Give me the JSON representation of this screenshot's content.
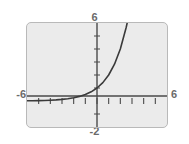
{
  "figure": {
    "name": "exponential-growth-graph-thumbnail",
    "background_color": "#ffffff",
    "plot_background_color": "#ebebeb",
    "frame_border_color": "#b9b9b9",
    "curve_color": "#3a3a3a",
    "axis_color": "#4a4a4a",
    "label_color": "#6b6b6b"
  },
  "labels": {
    "y_max": "6",
    "x_min": "-6",
    "x_max": "6",
    "y_min": "-2"
  },
  "chart_data": {
    "type": "line",
    "title": "",
    "subtitle": "",
    "xlabel": "",
    "ylabel": "",
    "xlim": [
      -6,
      6
    ],
    "ylim": [
      -2,
      6
    ],
    "xticks": [
      -6,
      -5,
      -4,
      -3,
      -2,
      -1,
      0,
      1,
      2,
      3,
      4,
      5,
      6
    ],
    "yticks": [
      -2,
      -1,
      0,
      1,
      2,
      3,
      4,
      5,
      6
    ],
    "xtick_labels": [
      "-6",
      "",
      "",
      "",
      "",
      "",
      "",
      "",
      "",
      "",
      "",
      "",
      "6"
    ],
    "ytick_labels": [
      "-2",
      "",
      "",
      "",
      "",
      "",
      "",
      "",
      "6"
    ],
    "grid": false,
    "legend": false,
    "legend_position": "none",
    "annotations": [],
    "series": [
      {
        "name": "exponential",
        "expression": "y = 2^x",
        "x": [
          -6,
          -5.5,
          -5,
          -4.5,
          -4,
          -3.5,
          -3,
          -2.5,
          -2,
          -1.5,
          -1,
          -0.5,
          0,
          0.5,
          1,
          1.5,
          2,
          2.5,
          2.585
        ],
        "y": [
          0.0156,
          0.0221,
          0.0313,
          0.0442,
          0.0625,
          0.0884,
          0.125,
          0.1768,
          0.25,
          0.3536,
          0.5,
          0.7071,
          1,
          1.4142,
          2,
          2.8284,
          4,
          5.6569,
          6
        ]
      }
    ]
  }
}
